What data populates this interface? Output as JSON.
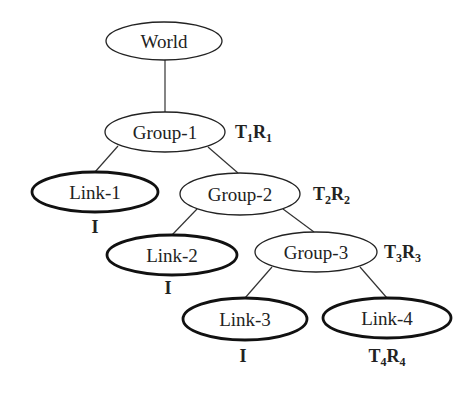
{
  "diagram": {
    "type": "scene-graph-tree",
    "nodes": [
      {
        "id": "world",
        "label": "World",
        "kind": "root",
        "cx": 164,
        "cy": 41,
        "rx": 58,
        "ry": 19
      },
      {
        "id": "group1",
        "label": "Group-1",
        "kind": "group",
        "cx": 165,
        "cy": 132,
        "rx": 60,
        "ry": 20
      },
      {
        "id": "link1",
        "label": "Link-1",
        "kind": "link",
        "cx": 95,
        "cy": 192,
        "rx": 63,
        "ry": 20
      },
      {
        "id": "group2",
        "label": "Group-2",
        "kind": "group",
        "cx": 240,
        "cy": 194,
        "rx": 60,
        "ry": 21
      },
      {
        "id": "link2",
        "label": "Link-2",
        "kind": "link",
        "cx": 172,
        "cy": 255,
        "rx": 65,
        "ry": 20
      },
      {
        "id": "group3",
        "label": "Group-3",
        "kind": "group",
        "cx": 316,
        "cy": 252,
        "rx": 61,
        "ry": 20
      },
      {
        "id": "link3",
        "label": "Link-3",
        "kind": "link",
        "cx": 245,
        "cy": 319,
        "rx": 62,
        "ry": 21
      },
      {
        "id": "link4",
        "label": "Link-4",
        "kind": "link",
        "cx": 387,
        "cy": 318,
        "rx": 64,
        "ry": 20
      }
    ],
    "edges": [
      {
        "from": "world",
        "to": "group1",
        "x1": 165,
        "y1": 60,
        "x2": 165,
        "y2": 112
      },
      {
        "from": "group1",
        "to": "link1",
        "x1": 118,
        "y1": 146,
        "x2": 95,
        "y2": 172
      },
      {
        "from": "group1",
        "to": "group2",
        "x1": 208,
        "y1": 147,
        "x2": 238,
        "y2": 173
      },
      {
        "from": "group2",
        "to": "link2",
        "x1": 197,
        "y1": 209,
        "x2": 172,
        "y2": 235
      },
      {
        "from": "group2",
        "to": "group3",
        "x1": 283,
        "y1": 209,
        "x2": 314,
        "y2": 232
      },
      {
        "from": "group3",
        "to": "link3",
        "x1": 272,
        "y1": 267,
        "x2": 245,
        "y2": 298
      },
      {
        "from": "group3",
        "to": "link4",
        "x1": 360,
        "y1": 267,
        "x2": 387,
        "y2": 298
      }
    ],
    "transforms": [
      {
        "node": "group1",
        "T": "T",
        "T_sub": "1",
        "R": "R",
        "R_sub": "1",
        "x": 235,
        "y": 138,
        "anchor": "start"
      },
      {
        "node": "link1",
        "identity": "I",
        "x": 95,
        "y": 233,
        "anchor": "middle"
      },
      {
        "node": "group2",
        "T": "T",
        "T_sub": "2",
        "R": "R",
        "R_sub": "2",
        "x": 313,
        "y": 200,
        "anchor": "start"
      },
      {
        "node": "link2",
        "identity": "I",
        "x": 168,
        "y": 294,
        "anchor": "middle"
      },
      {
        "node": "group3",
        "T": "T",
        "T_sub": "3",
        "R": "R",
        "R_sub": "3",
        "x": 384,
        "y": 258,
        "anchor": "start"
      },
      {
        "node": "link3",
        "identity": "I",
        "x": 243,
        "y": 362,
        "anchor": "middle"
      },
      {
        "node": "link4",
        "T": "T",
        "T_sub": "4",
        "R": "R",
        "R_sub": "4",
        "x": 387,
        "y": 362,
        "anchor": "middle"
      }
    ]
  }
}
